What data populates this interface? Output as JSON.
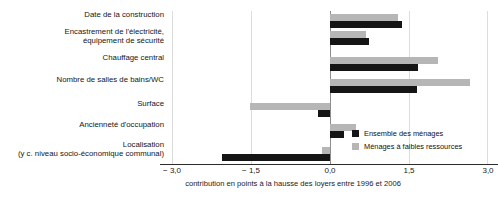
{
  "chart_title": "",
  "legend": {
    "position": "bottom-right",
    "entries": [
      {
        "label": "Ensemble des ménages",
        "color": "#151515"
      },
      {
        "label": "Ménages à faibles ressources",
        "color": "#b6b6b6"
      }
    ]
  },
  "axis": {
    "caption": "contribution en points à la hausse des loyers entre 1996 et 2006",
    "ticks": [
      "− 3,0",
      "− 1,5",
      "0,0",
      "1,5",
      "3,0"
    ],
    "tick_values": [
      -3.0,
      -1.5,
      0.0,
      1.5,
      3.0
    ]
  },
  "categories": [
    {
      "line1": "Date de la construction",
      "line2": ""
    },
    {
      "line1": "Encastrement de l'électricité,",
      "line2": "équipement de sécurité"
    },
    {
      "line1": "Chauffage central",
      "line2": ""
    },
    {
      "line1": "Nombre de salles de bains/WC",
      "line2": ""
    },
    {
      "line1": "Surface",
      "line2": ""
    },
    {
      "line1": "Ancienneté d'occupation",
      "line2": ""
    },
    {
      "line1": "Localisation",
      "line2": "(y c. niveau socio-économique communal)"
    }
  ],
  "chart_data": {
    "type": "bar",
    "orientation": "horizontal",
    "title": "",
    "xlabel": "contribution en points à la hausse des loyers entre 1996 et 2006",
    "ylabel": "",
    "xlim": [
      -3.0,
      3.0
    ],
    "grid": true,
    "legend_position": "bottom-right",
    "categories": [
      "Date de la construction",
      "Encastrement de l'électricité, équipement de sécurité",
      "Chauffage central",
      "Nombre de salles de bains/WC",
      "Surface",
      "Ancienneté d'occupation",
      "Localisation (y c. niveau socio-économique communal)"
    ],
    "series": [
      {
        "name": "Ensemble des ménages",
        "color": "#151515",
        "values": [
          1.37,
          0.74,
          1.67,
          1.65,
          -0.23,
          0.27,
          -2.05
        ]
      },
      {
        "name": "Ménages à faibles ressources",
        "color": "#b6b6b6",
        "values": [
          1.29,
          0.68,
          2.05,
          2.65,
          -1.52,
          0.49,
          -0.15
        ]
      }
    ]
  }
}
